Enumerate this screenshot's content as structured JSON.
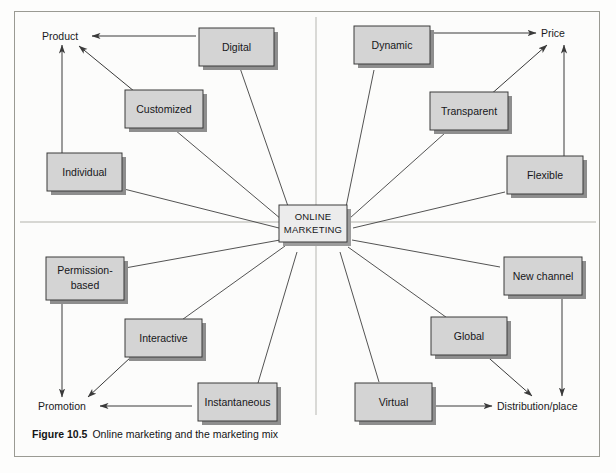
{
  "figure": {
    "caption_number": "Figure 10.5",
    "caption_text": "Online marketing and the marketing mix",
    "center_line1": "ONLINE",
    "center_line2": "MARKETING",
    "box_fill": "#d4d4d4",
    "box_stroke": "#3a3a3a",
    "shadow_fill": "#8e8e8e",
    "line_stroke": "#3f3f3f",
    "divider_stroke": "#c9c9c4",
    "frame_stroke": "#9a9a93",
    "background": "#fcfcfb"
  },
  "axes": [
    {
      "id": "product",
      "label": "Product",
      "quadrant": "top-left"
    },
    {
      "id": "price",
      "label": "Price",
      "quadrant": "top-right"
    },
    {
      "id": "promotion",
      "label": "Promotion",
      "quadrant": "bottom-left"
    },
    {
      "id": "place",
      "label": "Distribution/place",
      "quadrant": "bottom-right"
    }
  ],
  "nodes": [
    {
      "id": "digital",
      "label": "Digital",
      "axis": "product",
      "lines": [
        "Digital"
      ]
    },
    {
      "id": "customized",
      "label": "Customized",
      "axis": "product",
      "lines": [
        "Customized"
      ]
    },
    {
      "id": "individual",
      "label": "Individual",
      "axis": "product",
      "lines": [
        "Individual"
      ]
    },
    {
      "id": "dynamic",
      "label": "Dynamic",
      "axis": "price",
      "lines": [
        "Dynamic"
      ]
    },
    {
      "id": "transparent",
      "label": "Transparent",
      "axis": "price",
      "lines": [
        "Transparent"
      ]
    },
    {
      "id": "flexible",
      "label": "Flexible",
      "axis": "price",
      "lines": [
        "Flexible"
      ]
    },
    {
      "id": "permission",
      "label": "Permission-based",
      "axis": "promotion",
      "lines": [
        "Permission-",
        "based"
      ]
    },
    {
      "id": "interactive",
      "label": "Interactive",
      "axis": "promotion",
      "lines": [
        "Interactive"
      ]
    },
    {
      "id": "instantaneous",
      "label": "Instantaneous",
      "axis": "promotion",
      "lines": [
        "Instantaneous"
      ]
    },
    {
      "id": "newchannel",
      "label": "New channel",
      "axis": "place",
      "lines": [
        "New channel"
      ]
    },
    {
      "id": "global",
      "label": "Global",
      "axis": "place",
      "lines": [
        "Global"
      ]
    },
    {
      "id": "virtual",
      "label": "Virtual",
      "axis": "place",
      "lines": [
        "Virtual"
      ]
    }
  ]
}
